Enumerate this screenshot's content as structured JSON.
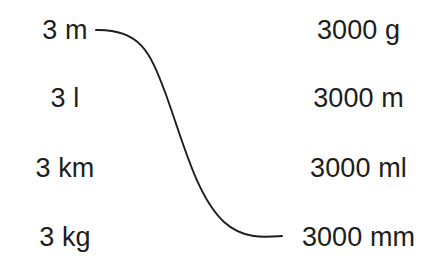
{
  "page": {
    "background_color": "#ffffff",
    "text_color": "#1d1d1b",
    "stroke_color": "#1d1d1b"
  },
  "left_column": {
    "name": "quantities",
    "items": [
      {
        "label": "3 m",
        "value": "3",
        "unit": "m"
      },
      {
        "label": "3 l",
        "value": "3",
        "unit": "l"
      },
      {
        "label": "3 km",
        "value": "3",
        "unit": "km"
      },
      {
        "label": "3 kg",
        "value": "3",
        "unit": "kg"
      }
    ]
  },
  "right_column": {
    "name": "equivalents",
    "items": [
      {
        "label": "3000 g",
        "value": "3000",
        "unit": "g"
      },
      {
        "label": "3000 m",
        "value": "3000",
        "unit": "m"
      },
      {
        "label": "3000 ml",
        "value": "3000",
        "unit": "ml"
      },
      {
        "label": "3000 mm",
        "value": "3000",
        "unit": "mm"
      }
    ]
  },
  "connectors": [
    {
      "name": "connector-3m-to-3000mm",
      "from_label": "3 m",
      "to_label": "3000 mm",
      "from_index": 0,
      "to_index": 3,
      "path": "M 96 30 C 140 29 150 52 165 92 C 182 138 196 196 224 222 C 244 240 266 237 282 236"
    }
  ]
}
